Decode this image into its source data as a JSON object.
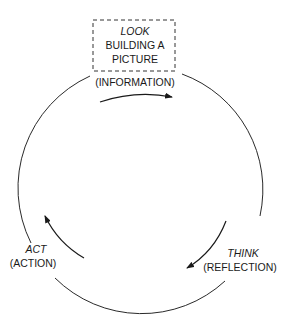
{
  "diagram": {
    "type": "cycle",
    "stages": [
      {
        "id": "look",
        "title": "LOOK",
        "subtitle_lines": [
          "BUILDING A",
          "PICTURE"
        ],
        "detail": "(INFORMATION)",
        "boxed": true
      },
      {
        "id": "think",
        "title": "THINK",
        "detail": "(REFLECTION)"
      },
      {
        "id": "act",
        "title": "ACT",
        "detail": "(ACTION)"
      }
    ],
    "flow": [
      "LOOK",
      "THINK",
      "ACT",
      "LOOK"
    ],
    "direction": "clockwise",
    "colors": {
      "line": "#2a2a2a",
      "text": "#1a1a1a",
      "background": "#ffffff"
    }
  }
}
